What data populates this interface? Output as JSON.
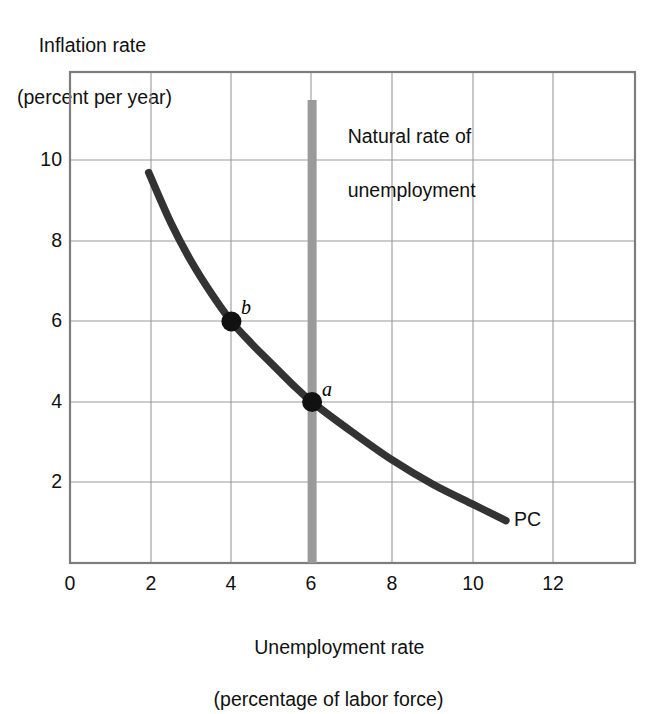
{
  "chart_data": {
    "type": "line",
    "title": "",
    "xlabel": "Unemployment rate",
    "xlabel_line2": "(percentage of labor force)",
    "ylabel": "Inflation rate",
    "ylabel_line2": "(percent per year)",
    "xlim": [
      0,
      14
    ],
    "ylim": [
      0,
      12.2
    ],
    "xticks": [
      "0",
      "2",
      "4",
      "6",
      "8",
      "10",
      "12"
    ],
    "xtick_values": [
      0,
      2,
      4,
      6,
      8,
      10,
      12
    ],
    "yticks": [
      "2",
      "4",
      "6",
      "8",
      "10"
    ],
    "ytick_values": [
      2,
      4,
      6,
      8,
      10
    ],
    "grid": true,
    "legend": "none",
    "series": [
      {
        "name": "PC",
        "label": "PC",
        "color": "#333333",
        "points": [
          {
            "x": 1.95,
            "y": 9.7
          },
          {
            "x": 2.5,
            "y": 8.45
          },
          {
            "x": 3.0,
            "y": 7.5
          },
          {
            "x": 3.5,
            "y": 6.7
          },
          {
            "x": 4.0,
            "y": 6.0
          },
          {
            "x": 4.5,
            "y": 5.45
          },
          {
            "x": 5.0,
            "y": 4.95
          },
          {
            "x": 5.5,
            "y": 4.45
          },
          {
            "x": 6.0,
            "y": 4.0
          },
          {
            "x": 7.0,
            "y": 3.25
          },
          {
            "x": 8.0,
            "y": 2.55
          },
          {
            "x": 9.0,
            "y": 1.95
          },
          {
            "x": 10.0,
            "y": 1.45
          },
          {
            "x": 10.8,
            "y": 1.05
          }
        ]
      }
    ],
    "markers": [
      {
        "label": "a",
        "x": 6,
        "y": 4
      },
      {
        "label": "b",
        "x": 4,
        "y": 6
      }
    ],
    "annotations": [
      {
        "name": "natural-rate-of-unemployment",
        "text": "Natural rate of",
        "text_line2": "unemployment",
        "x": 6,
        "vertical_band": true,
        "band_color": "#9a9a9a"
      }
    ],
    "colors": {
      "curve": "#333333",
      "grid": "#9a9a9a",
      "frame": "#808080",
      "natural_rate_band": "#9a9a9a",
      "text": "#111111",
      "background": "#ffffff"
    }
  },
  "chart": {
    "y_axis_title_line1": "Inflation rate",
    "y_axis_title_line2": "(percent per year)",
    "x_axis_title_line1": "Unemployment rate",
    "x_axis_title_line2": "(percentage of labor force)",
    "natural_rate_note_line1": "Natural rate of",
    "natural_rate_note_line2": "unemployment",
    "curve_label": "PC",
    "point_a_label": "a",
    "point_b_label": "b",
    "x_tick_0": "0",
    "x_tick_2": "2",
    "x_tick_4": "4",
    "x_tick_6": "6",
    "x_tick_8": "8",
    "x_tick_10": "10",
    "x_tick_12": "12",
    "y_tick_2": "2",
    "y_tick_4": "4",
    "y_tick_6": "6",
    "y_tick_8": "8",
    "y_tick_10": "10"
  }
}
